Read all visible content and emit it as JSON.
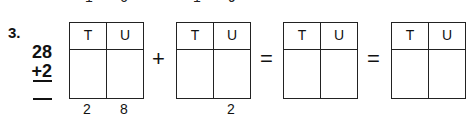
{
  "problem": {
    "number": "3.",
    "addend1": "28",
    "addend2": "+2",
    "answer_line": "—"
  },
  "clipped_top_digits": [
    "1",
    "6",
    "1",
    "9"
  ],
  "boxes": [
    {
      "tens_header": "T",
      "units_header": "U",
      "below_tens": "2",
      "below_units": "8"
    },
    {
      "tens_header": "T",
      "units_header": "U",
      "below_tens": "",
      "below_units": "2"
    },
    {
      "tens_header": "T",
      "units_header": "U",
      "below_tens": "",
      "below_units": ""
    },
    {
      "tens_header": "T",
      "units_header": "U",
      "below_tens": "",
      "below_units": ""
    }
  ],
  "operators": {
    "plus": "+",
    "equals1": "=",
    "equals2": "="
  }
}
